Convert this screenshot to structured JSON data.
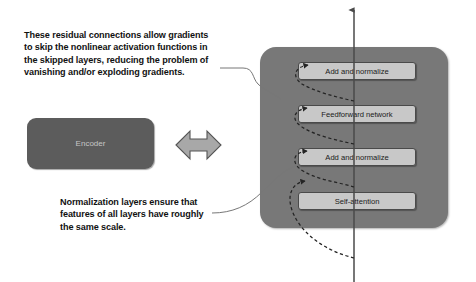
{
  "diagram": {
    "background_color": "#ffffff",
    "callouts": [
      {
        "id": "residual",
        "text": "These residual connections allow gradients\nto skip the nonlinear activation functions in\nthe skipped layers, reducing the problem of\nvanishing and/or exploding gradients."
      },
      {
        "id": "normalization",
        "text": "Normalization layers ensure that\nfeatures of all layers have roughly\nthe same scale."
      }
    ],
    "encoder": {
      "label": "Encoder",
      "fill_color": "#5c5c5c",
      "text_color": "#c6c6c6"
    },
    "equivalence_arrow": {
      "icon": "double-headed-arrow",
      "fill_color": "#a8a8a8",
      "stroke_color": "#555555"
    },
    "panel": {
      "fill_color": "#787878",
      "layers": [
        {
          "label": "Add and normalize"
        },
        {
          "label": "Feedforward network"
        },
        {
          "label": "Add and normalize"
        },
        {
          "label": "Self-attention"
        }
      ],
      "layer_fill_color": "#c8c8c8",
      "layer_border_color": "#4a4a4a"
    },
    "flow": {
      "main_arrow_direction": "upward",
      "main_arrow_color": "#555555",
      "residual_connection_style": "dashed-curve",
      "residual_connection_color": "#2a2a2a"
    }
  }
}
